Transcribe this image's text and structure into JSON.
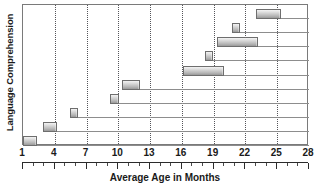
{
  "chart_data": {
    "type": "bar",
    "orientation": "horizontal",
    "subtype": "range-bar",
    "title": "",
    "xlabel": "Average Age in Months",
    "ylabel": "Language Comprehension",
    "xlim": [
      1,
      28
    ],
    "ylim": [
      0,
      10
    ],
    "grid": "vertical-dotted-at-major-ticks",
    "legend": "none",
    "xtick_labels": [
      "1",
      "4",
      "7",
      "10",
      "13",
      "16",
      "19",
      "22",
      "25",
      "28"
    ],
    "xticks": [
      1,
      4,
      7,
      10,
      13,
      16,
      19,
      22,
      25,
      28
    ],
    "minor_tick_interval": 1,
    "ytick_labels": [],
    "categories": [
      "row-1",
      "row-2",
      "row-3",
      "row-4",
      "row-5",
      "row-6",
      "row-7",
      "row-8",
      "row-9",
      "row-10"
    ],
    "series": [
      {
        "name": "Age range (months)",
        "ranges": [
          {
            "row": 1,
            "start": 1.0,
            "end": 2.3
          },
          {
            "row": 2,
            "start": 2.9,
            "end": 4.2
          },
          {
            "row": 3,
            "start": 5.4,
            "end": 6.2
          },
          {
            "row": 4,
            "start": 9.2,
            "end": 10.1
          },
          {
            "row": 5,
            "start": 10.3,
            "end": 12.0
          },
          {
            "row": 6,
            "start": 16.1,
            "end": 20.0
          },
          {
            "row": 7,
            "start": 18.2,
            "end": 18.9
          },
          {
            "row": 8,
            "start": 19.3,
            "end": 23.2
          },
          {
            "row": 9,
            "start": 20.7,
            "end": 21.5
          },
          {
            "row": 10,
            "start": 23.0,
            "end": 25.4
          }
        ]
      }
    ],
    "colors": {
      "bar_fill_light": "#f3f3f3",
      "bar_fill_dark": "#9a9a9a",
      "bar_border": "#6e6e6e",
      "gridline": "#55555a",
      "row_line": "#8d8d8d",
      "frame": "#7a7a7a",
      "text": "#1a1a1a",
      "background": "#ffffff"
    }
  },
  "axes": {
    "x_title": "Average Age in Months",
    "y_title": "Language Comprehension"
  }
}
